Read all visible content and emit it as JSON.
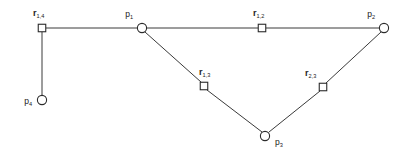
{
  "figure": {
    "width": 406,
    "height": 157,
    "background_color": "#ffffff",
    "line_color": "#3a3a3a",
    "node_stroke_color": "#2b2b2b",
    "node_fill_color": "#ffffff"
  },
  "nodes": {
    "p1": {
      "id": "p1",
      "shape": "circle",
      "x": 142,
      "y": 28,
      "radius": 4.6,
      "label_base": "p",
      "label_sub": "1",
      "label_x": 133,
      "label_y": 17,
      "label_anchor": "end"
    },
    "p2": {
      "id": "p2",
      "shape": "circle",
      "x": 384,
      "y": 28,
      "radius": 4.6,
      "label_base": "p",
      "label_sub": "2",
      "label_x": 375,
      "label_y": 17,
      "label_anchor": "end"
    },
    "p3": {
      "id": "p3",
      "shape": "circle",
      "x": 265,
      "y": 136,
      "radius": 4.6,
      "label_base": "p",
      "label_sub": "3",
      "label_x": 275,
      "label_y": 145,
      "label_anchor": "start"
    },
    "p4": {
      "id": "p4",
      "shape": "circle",
      "x": 42,
      "y": 100,
      "radius": 4.6,
      "label_base": "p",
      "label_sub": "4",
      "label_x": 32,
      "label_y": 104,
      "label_anchor": "end"
    },
    "r14": {
      "id": "r_1,4",
      "shape": "square",
      "x": 42,
      "y": 28,
      "size": 7.5,
      "label_base": "r",
      "label_sub": "1,4",
      "label_x": 33,
      "label_y": 16,
      "label_anchor": "start"
    },
    "r12": {
      "id": "r_1,2",
      "shape": "square",
      "x": 262,
      "y": 28,
      "size": 7.5,
      "label_base": "r",
      "label_sub": "1,2",
      "label_x": 253,
      "label_y": 16,
      "label_anchor": "start"
    },
    "r13": {
      "id": "r_1,3",
      "shape": "square",
      "x": 204,
      "y": 86,
      "size": 7.5,
      "label_base": "r",
      "label_sub": "1,3",
      "label_x": 199,
      "label_y": 75,
      "label_anchor": "start"
    },
    "r23": {
      "id": "r_2,3",
      "shape": "square",
      "x": 323,
      "y": 87,
      "size": 7.5,
      "label_base": "r",
      "label_sub": "2,3",
      "label_x": 305,
      "label_y": 76,
      "label_anchor": "start"
    }
  },
  "edges": [
    {
      "id": "edge-r14-p4",
      "from": "r14",
      "to": "p4",
      "x1": 42,
      "y1": 32,
      "x2": 42,
      "y2": 96
    },
    {
      "id": "edge-r14-p1",
      "from": "r14",
      "to": "p1",
      "x1": 46,
      "y1": 28,
      "x2": 137,
      "y2": 28
    },
    {
      "id": "edge-p1-r12",
      "from": "p1",
      "to": "r12",
      "x1": 147,
      "y1": 28,
      "x2": 258,
      "y2": 28
    },
    {
      "id": "edge-r12-p2",
      "from": "r12",
      "to": "p2",
      "x1": 266,
      "y1": 28,
      "x2": 379,
      "y2": 28
    },
    {
      "id": "edge-p1-r13",
      "from": "p1",
      "to": "r13",
      "x1": 145,
      "y1": 32,
      "x2": 201,
      "y2": 82
    },
    {
      "id": "edge-r13-p3",
      "from": "r13",
      "to": "p3",
      "x1": 207,
      "y1": 90,
      "x2": 262,
      "y2": 132
    },
    {
      "id": "edge-p3-r23",
      "from": "p3",
      "to": "r23",
      "x1": 269,
      "y1": 132,
      "x2": 320,
      "y2": 91
    },
    {
      "id": "edge-r23-p2",
      "from": "r23",
      "to": "p2",
      "x1": 326,
      "y1": 83,
      "x2": 381,
      "y2": 32
    }
  ]
}
